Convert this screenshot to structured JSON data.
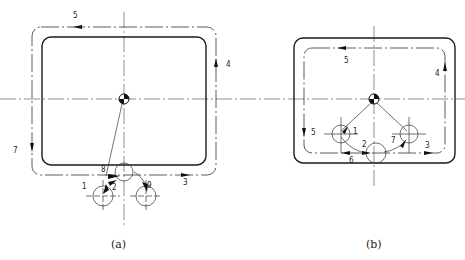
{
  "figure": {
    "panel_a": {
      "caption": "(a)",
      "labels": {
        "l1": "1",
        "l2": "2",
        "l3": "3",
        "l4": "4",
        "l5": "5",
        "l7": "7",
        "l8": "8",
        "l9": "9"
      }
    },
    "panel_b": {
      "caption": "(b)",
      "labels": {
        "l1": "1",
        "l2": "2",
        "l3": "3",
        "l4": "4",
        "l5a": "5",
        "l5b": "5",
        "l6": "6",
        "l7": "7"
      }
    }
  }
}
